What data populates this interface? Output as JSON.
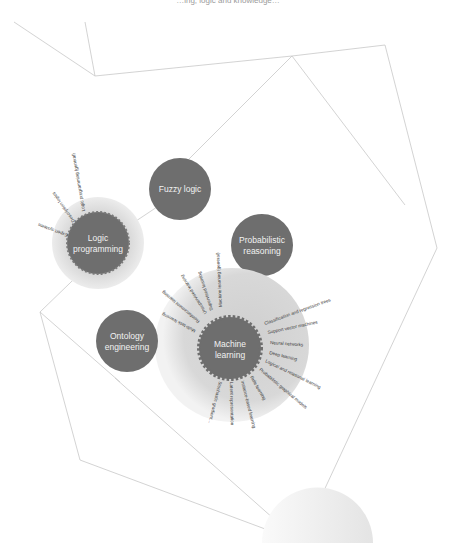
{
  "header": {
    "caption": "…ing, logic and knowledge…"
  },
  "nodes": {
    "fuzzy_logic": {
      "label": "Fuzzy logic"
    },
    "logic_programming": {
      "label_line1": "Logic",
      "label_line2": "programming",
      "leaves": [
        "Expert systems",
        "Description logics",
        "Logic programming (general)"
      ]
    },
    "probabilistic_reasoning": {
      "label_line1": "Probabilistic",
      "label_line2": "reasoning"
    },
    "ontology_engineering": {
      "label_line1": "Ontology",
      "label_line2": "engineering"
    },
    "machine_learning": {
      "label_line1": "Machine",
      "label_line2": "learning",
      "leaves_left": [
        "Multi-task learning",
        "Reinforcement learning",
        "Unsupervised learning",
        "Supervised learning",
        "Machine learning (general)"
      ],
      "leaves_right": [
        "Classification and regression trees",
        "Support vector machines",
        "Neural networks",
        "Deep learning",
        "Logical and relational learning",
        "Probabilistic graphical models"
      ],
      "leaves_bottom": [
        "Rule learning",
        "Instance-based learning",
        "Latent representation",
        "Stochastic gradient…"
      ]
    }
  },
  "colors": {
    "node_fill": "#6e6e6e",
    "halo_fill": "#d9d9d9",
    "edge": "#c8c8c8",
    "node_text": "#f2f2f2",
    "leaf_text": "#3a3a3a"
  }
}
